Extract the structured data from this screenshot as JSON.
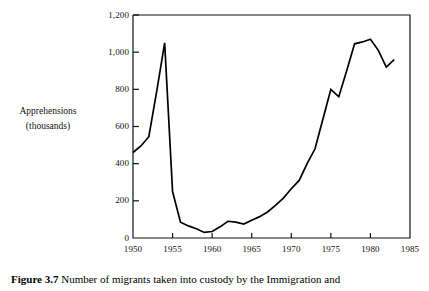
{
  "figure": {
    "caption_label": "Figure 3.7",
    "caption_text": "Number of migrants taken into custody by the Immigration and"
  },
  "axis_titles": {
    "y_line1": "Apprehensions",
    "y_line2": "(thousands)"
  },
  "chart_data": {
    "type": "line",
    "title": "",
    "xlabel": "",
    "ylabel": "Apprehensions (thousands)",
    "xlim": [
      1950,
      1985
    ],
    "ylim": [
      0,
      1200
    ],
    "grid": false,
    "legend": "none",
    "line_color": "#000000",
    "xticks": [
      1950,
      1955,
      1960,
      1965,
      1970,
      1975,
      1980,
      1985
    ],
    "xtick_labels": [
      "1950",
      "1955",
      "1960",
      "1965",
      "1970",
      "1975",
      "1980",
      "1985"
    ],
    "yticks": [
      0,
      200,
      400,
      600,
      800,
      1000,
      1200
    ],
    "ytick_labels": [
      "0",
      "200",
      "400",
      "600",
      "800",
      "1,000",
      "1,200"
    ],
    "series": [
      {
        "name": "Apprehensions",
        "x": [
          1950,
          1951,
          1952,
          1953,
          1954,
          1955,
          1956,
          1957,
          1958,
          1959,
          1960,
          1961,
          1962,
          1963,
          1964,
          1965,
          1966,
          1967,
          1968,
          1969,
          1970,
          1971,
          1972,
          1973,
          1974,
          1975,
          1976,
          1977,
          1978,
          1979,
          1980,
          1981,
          1982,
          1983
        ],
        "y": [
          460,
          495,
          545,
          790,
          1050,
          250,
          85,
          65,
          50,
          30,
          35,
          60,
          90,
          85,
          75,
          95,
          115,
          140,
          175,
          215,
          265,
          310,
          400,
          480,
          640,
          800,
          760,
          900,
          1045,
          1055,
          1070,
          1010,
          920,
          960
        ]
      }
    ]
  }
}
